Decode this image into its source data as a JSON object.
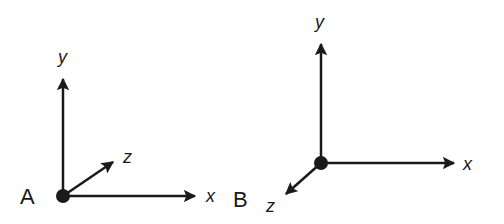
{
  "diagram": {
    "stroke_color": "#1a1a1a",
    "background": "#ffffff",
    "systems": [
      {
        "name": "A",
        "label": "A",
        "axes": {
          "x": "x",
          "y": "y",
          "z": "z"
        },
        "z_direction": "into page (up-right)"
      },
      {
        "name": "B",
        "label": "B",
        "axes": {
          "x": "x",
          "y": "y",
          "z": "z"
        },
        "z_direction": "out of page (down-left)"
      }
    ]
  }
}
